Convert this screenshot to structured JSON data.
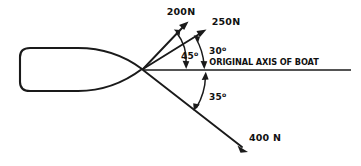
{
  "diagram": {
    "background_color": "#ffffff",
    "ink_color": "#1a1a1a",
    "axis": {
      "label": "ORIGINAL AXIS OF BOAT",
      "name": "original-axis-of-boat"
    },
    "vectors": [
      {
        "id": "force-200n",
        "label": "200N",
        "magnitude": 200,
        "unit": "N",
        "angle_deg": 45,
        "direction": "above-axis"
      },
      {
        "id": "force-250n",
        "label": "250N",
        "magnitude": 250,
        "unit": "N",
        "angle_deg": 30,
        "direction": "above-axis"
      },
      {
        "id": "force-400n",
        "label": "400 N",
        "magnitude": 400,
        "unit": "N",
        "angle_deg": 35,
        "direction": "below-axis"
      }
    ],
    "angles": [
      {
        "id": "angle-45",
        "value": "45",
        "degree_symbol": "o",
        "between": "original-axis-and-200n"
      },
      {
        "id": "angle-30",
        "value": "30",
        "degree_symbol": "o",
        "between": "original-axis-and-250n"
      },
      {
        "id": "angle-35",
        "value": "35",
        "degree_symbol": "o",
        "between": "original-axis-and-400n"
      }
    ],
    "boat": {
      "name": "boat-hull",
      "description": "hull outline with rounded stern and pointed bow"
    }
  }
}
